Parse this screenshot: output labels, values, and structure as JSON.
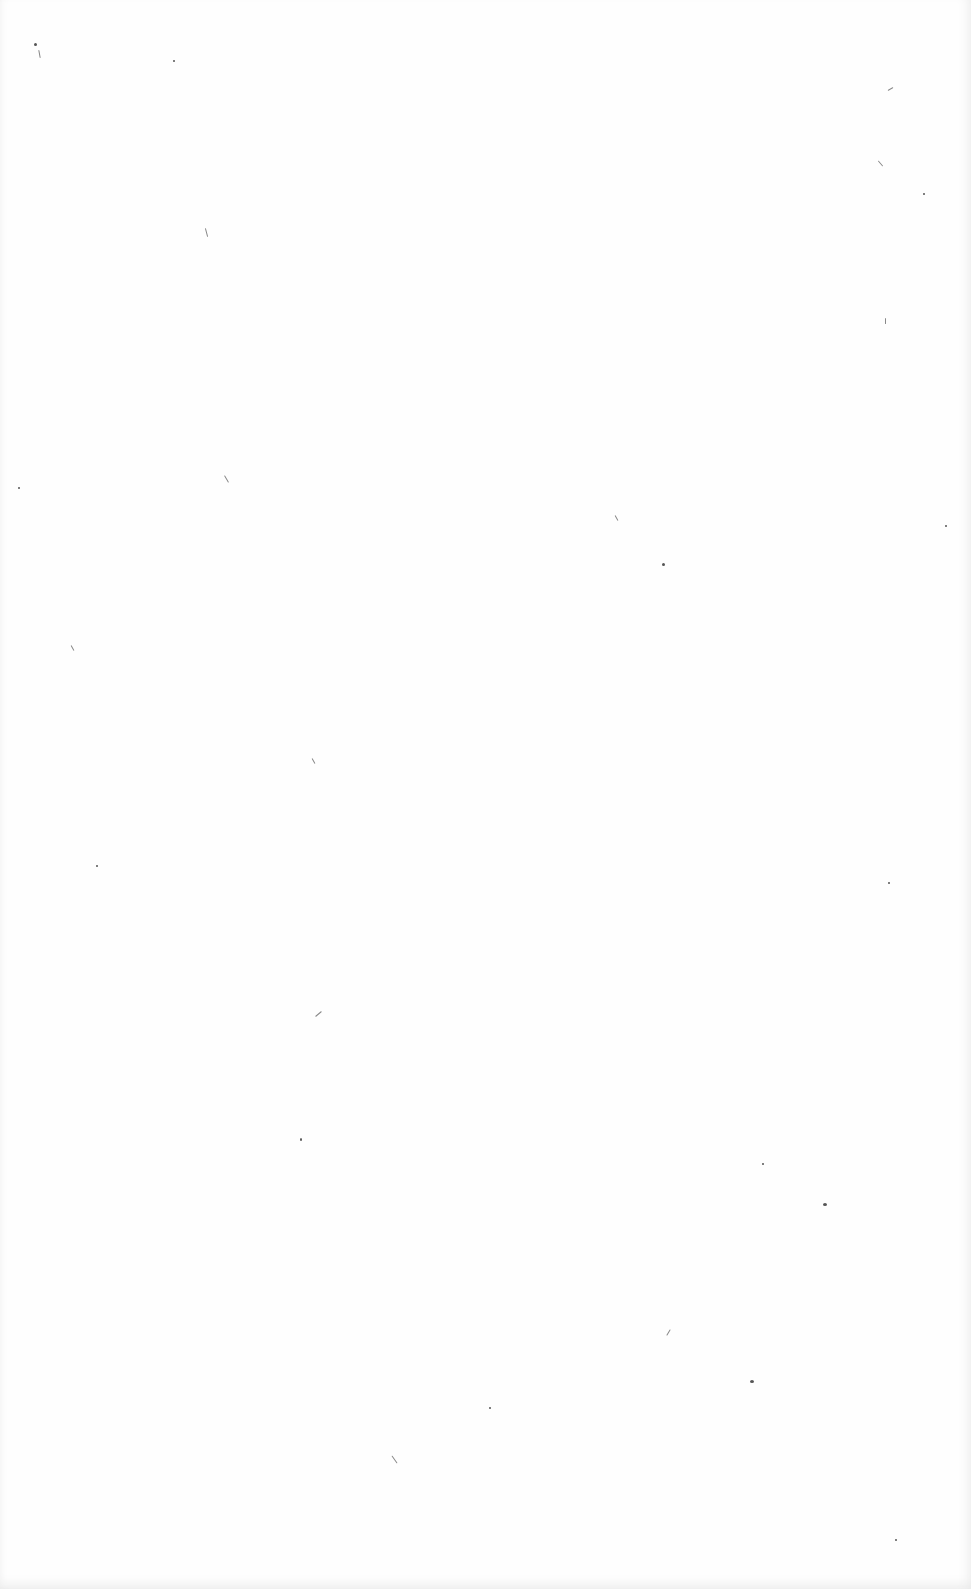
{
  "document": {
    "type": "blank scanned page",
    "text": "",
    "background_color": "#fefefe",
    "speck_color": "#555555"
  }
}
